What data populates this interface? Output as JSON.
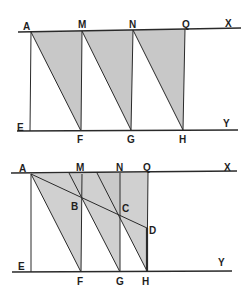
{
  "figures": [
    {
      "id": "figure-1",
      "lines": {
        "top": {
          "x1": 18,
          "y1": 32,
          "x2": 241,
          "y2": 28,
          "end_label": "X"
        },
        "bottom": {
          "x1": 17,
          "y1": 131,
          "x2": 238,
          "y2": 130,
          "end_label": "Y"
        }
      },
      "points": {
        "A": [
          31,
          32
        ],
        "M": [
          82,
          31
        ],
        "N": [
          133,
          30
        ],
        "Q": [
          185,
          29
        ],
        "E": [
          30,
          131
        ],
        "F": [
          81,
          131
        ],
        "G": [
          131,
          130
        ],
        "H": [
          183,
          130
        ]
      },
      "shaded_triangles": [
        [
          "A",
          "M",
          "F"
        ],
        [
          "M",
          "N",
          "G"
        ],
        [
          "N",
          "Q",
          "H"
        ]
      ],
      "segments": [
        [
          "A",
          "E"
        ],
        [
          "M",
          "F"
        ],
        [
          "N",
          "G"
        ],
        [
          "Q",
          "H"
        ],
        [
          "A",
          "F"
        ],
        [
          "M",
          "G"
        ],
        [
          "N",
          "H"
        ]
      ],
      "labels": [
        {
          "text": "A",
          "x": 23,
          "y": 30
        },
        {
          "text": "M",
          "x": 78,
          "y": 28
        },
        {
          "text": "N",
          "x": 129,
          "y": 28
        },
        {
          "text": "Q",
          "x": 182,
          "y": 28
        },
        {
          "text": "X",
          "x": 225,
          "y": 27
        },
        {
          "text": "E",
          "x": 17,
          "y": 131
        },
        {
          "text": "F",
          "x": 77,
          "y": 143
        },
        {
          "text": "G",
          "x": 127,
          "y": 143
        },
        {
          "text": "H",
          "x": 179,
          "y": 143
        },
        {
          "text": "Y",
          "x": 223,
          "y": 127
        }
      ]
    },
    {
      "id": "figure-2",
      "lines": {
        "top": {
          "x1": 11,
          "y1": 173,
          "x2": 237,
          "y2": 171,
          "end_label": "X"
        },
        "bottom": {
          "x1": 12,
          "y1": 272,
          "x2": 232,
          "y2": 271,
          "end_label": "Y"
        }
      },
      "points": {
        "A": [
          31,
          174
        ],
        "M": [
          82,
          174
        ],
        "N": [
          120,
          173
        ],
        "Q": [
          148,
          173
        ],
        "E": [
          31,
          272
        ],
        "F": [
          81,
          272
        ],
        "G": [
          120,
          272
        ],
        "H": [
          147,
          271
        ],
        "B": [
          81,
          198
        ],
        "C": [
          120,
          215
        ],
        "D": [
          147,
          228
        ],
        "M2": [
          69,
          173
        ],
        "N2": [
          97,
          173
        ]
      },
      "shaded_regions": [
        [
          [
            31,
            174
          ],
          [
            82,
            174
          ],
          [
            81,
            272
          ]
        ],
        [
          [
            69,
            173
          ],
          [
            120,
            173
          ],
          [
            120,
            272
          ]
        ],
        [
          [
            97,
            173
          ],
          [
            148,
            173
          ],
          [
            147,
            271
          ]
        ]
      ],
      "segments": [
        [
          "A",
          "E"
        ],
        [
          "M",
          "F"
        ],
        [
          "N",
          "G"
        ],
        [
          "Q",
          "H"
        ],
        [
          "A",
          "F"
        ],
        [
          "M2",
          "G"
        ],
        [
          "N2",
          "H"
        ],
        [
          "A",
          "D"
        ]
      ],
      "thick_segments": [
        [
          "D",
          "H"
        ]
      ],
      "labels": [
        {
          "text": "A",
          "x": 19,
          "y": 172
        },
        {
          "text": "M",
          "x": 76,
          "y": 171
        },
        {
          "text": "N",
          "x": 116,
          "y": 171
        },
        {
          "text": "Q",
          "x": 143,
          "y": 171
        },
        {
          "text": "X",
          "x": 224,
          "y": 171
        },
        {
          "text": "B",
          "x": 71,
          "y": 210
        },
        {
          "text": "C",
          "x": 122,
          "y": 212
        },
        {
          "text": "D",
          "x": 149,
          "y": 234
        },
        {
          "text": "E",
          "x": 18,
          "y": 270
        },
        {
          "text": "F",
          "x": 77,
          "y": 285
        },
        {
          "text": "G",
          "x": 116,
          "y": 285
        },
        {
          "text": "H",
          "x": 142,
          "y": 285
        },
        {
          "text": "Y",
          "x": 218,
          "y": 266
        }
      ]
    }
  ],
  "colors": {
    "line": "#2a2a2a",
    "shade": "#c8c8c8",
    "label": "#1e1e1e",
    "background": "#ffffff"
  }
}
